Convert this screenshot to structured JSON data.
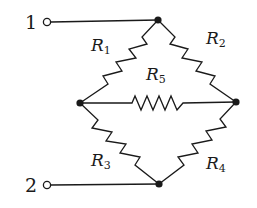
{
  "diagram": {
    "type": "circuit",
    "terminals": [
      {
        "id": "1",
        "label": "1"
      },
      {
        "id": "2",
        "label": "2"
      }
    ],
    "resistors": [
      {
        "id": "R1",
        "symbol": "R",
        "subscript": "1",
        "from": "top",
        "to": "left"
      },
      {
        "id": "R2",
        "symbol": "R",
        "subscript": "2",
        "from": "top",
        "to": "right"
      },
      {
        "id": "R3",
        "symbol": "R",
        "subscript": "3",
        "from": "left",
        "to": "bottom"
      },
      {
        "id": "R4",
        "symbol": "R",
        "subscript": "4",
        "from": "right",
        "to": "bottom"
      },
      {
        "id": "R5",
        "symbol": "R",
        "subscript": "5",
        "from": "left",
        "to": "right"
      }
    ],
    "connections": [
      {
        "from": "terminal-1",
        "to": "top"
      },
      {
        "from": "terminal-2",
        "to": "bottom"
      }
    ],
    "colors": {
      "ink": "#1a1a1a",
      "background": "#ffffff"
    }
  }
}
